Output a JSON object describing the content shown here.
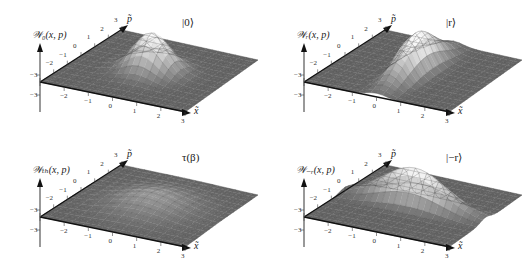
{
  "figure": {
    "panels": [
      {
        "id": "vacuum",
        "zlabel": "𝒲₀(x, p)",
        "state_label": "|0⟩"
      },
      {
        "id": "squeezed",
        "zlabel": "𝒲ᵣ(x, p)",
        "state_label": "|r⟩"
      },
      {
        "id": "thermal",
        "zlabel": "𝒲ₜₕ(x, p)",
        "state_label": "τ(β)"
      },
      {
        "id": "antisqueezed",
        "zlabel": "𝒲₋ᵣ(x, p)",
        "state_label": "|−r⟩"
      }
    ],
    "x_axis_label": "x̃",
    "p_axis_label": "p̃",
    "x_ticks": [
      "−3",
      "−2",
      "−1",
      "0",
      "1",
      "2",
      "3"
    ],
    "p_ticks": [
      "−3",
      "−2",
      "−1",
      "0",
      "1",
      "2",
      "3"
    ]
  },
  "chart_data": [
    {
      "type": "surface",
      "title": "|0⟩",
      "zlabel": "W_0(x,p)",
      "xlabel": "x̃",
      "ylabel": "p̃",
      "xlim": [
        -3,
        3
      ],
      "ylim": [
        -3,
        3
      ],
      "function": "gaussian",
      "center": [
        0,
        0
      ],
      "sigma_x": 0.7,
      "sigma_p": 0.7,
      "peak_relative": 1.0,
      "grid": true
    },
    {
      "type": "surface",
      "title": "|r⟩",
      "zlabel": "W_r(x,p)",
      "xlabel": "x̃",
      "ylabel": "p̃",
      "xlim": [
        -3,
        3
      ],
      "ylim": [
        -3,
        3
      ],
      "function": "gaussian",
      "center": [
        0,
        0
      ],
      "sigma_x": 0.4,
      "sigma_p": 1.4,
      "peak_relative": 1.0,
      "grid": true
    },
    {
      "type": "surface",
      "title": "τ(β)",
      "zlabel": "W_th(x,p)",
      "xlabel": "x̃",
      "ylabel": "p̃",
      "xlim": [
        -3,
        3
      ],
      "ylim": [
        -3,
        3
      ],
      "function": "gaussian",
      "center": [
        0,
        0
      ],
      "sigma_x": 1.2,
      "sigma_p": 1.2,
      "peak_relative": 0.35,
      "grid": true
    },
    {
      "type": "surface",
      "title": "|−r⟩",
      "zlabel": "W_-r(x,p)",
      "xlabel": "x̃",
      "ylabel": "p̃",
      "xlim": [
        -3,
        3
      ],
      "ylim": [
        -3,
        3
      ],
      "function": "gaussian",
      "center": [
        0,
        0
      ],
      "sigma_x": 1.4,
      "sigma_p": 0.4,
      "peak_relative": 1.0,
      "grid": true
    }
  ]
}
